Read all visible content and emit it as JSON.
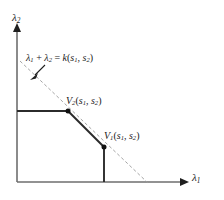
{
  "figure": {
    "type": "2d-geometric-diagram",
    "background_color": "#ffffff",
    "line_color": "#2b2b2b",
    "axis_color": "#6e6e6e",
    "dashed_line_color": "#9a9a9a"
  },
  "axes": {
    "x": {
      "label_base": "λ",
      "label_sub": "1",
      "origin_px": [
        17,
        182
      ],
      "arrow_tip_px": [
        186,
        182
      ]
    },
    "y": {
      "label_base": "λ",
      "label_sub": "2",
      "origin_px": [
        17,
        182
      ],
      "arrow_tip_px": [
        17,
        25
      ]
    }
  },
  "annotations": {
    "constraint_line": {
      "text_parts": {
        "lam": "λ",
        "sub1": "1",
        "plus": " + ",
        "sub2": "2",
        "equals": " = ",
        "k": "k",
        "open": "(",
        "s": "s",
        "s_sub1": "1",
        "comma": ", ",
        "s_sub2": "2",
        "close": ")"
      },
      "full_text": "λ1 + λ2 = k(s1, s2)",
      "pointer_from_px": [
        44,
        66
      ],
      "pointer_to_px": [
        31,
        79
      ]
    },
    "vertex_v2": {
      "name": "V",
      "name_sub": "2",
      "args": "(s1, s2)",
      "point_px": [
        68,
        111
      ],
      "marker": "filled-dot"
    },
    "vertex_v1": {
      "name": "V",
      "name_sub": "1",
      "args": "(s1, s2)",
      "point_px": [
        104,
        147
      ],
      "marker": "filled-dot"
    }
  },
  "geometry": {
    "dashed_constraint_line": {
      "from_px": [
        20,
        61
      ],
      "to_px": [
        148,
        183
      ],
      "style": "dashed"
    },
    "frontier_path": {
      "description": "horizontal from y-axis to V2, diagonal V2 to V1, vertical V1 down to x-axis",
      "points_px": [
        [
          17,
          111
        ],
        [
          68,
          111
        ],
        [
          104,
          147
        ],
        [
          104,
          182
        ]
      ],
      "style": "solid"
    }
  }
}
